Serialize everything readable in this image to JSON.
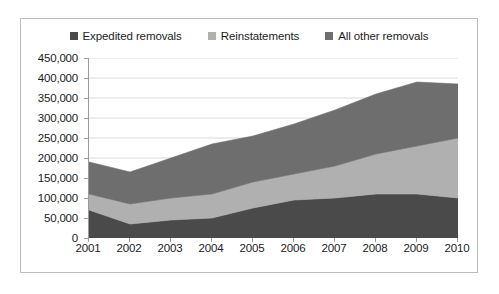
{
  "legend": {
    "position": "top-center",
    "items": [
      {
        "label": "Expedited removals",
        "color": "#4a4a4a",
        "icon": "square-marker"
      },
      {
        "label": "Reinstatements",
        "color": "#b0b0b0",
        "icon": "square-marker"
      },
      {
        "label": "All other removals",
        "color": "#6e6e6e",
        "icon": "square-marker"
      }
    ]
  },
  "chart_data": {
    "type": "area",
    "stacked": true,
    "title": "",
    "subtitle": "",
    "xlabel": "",
    "ylabel": "",
    "grid": true,
    "categories": [
      "2001",
      "2002",
      "2003",
      "2004",
      "2005",
      "2006",
      "2007",
      "2008",
      "2009",
      "2010"
    ],
    "x": [
      2001,
      2002,
      2003,
      2004,
      2005,
      2006,
      2007,
      2008,
      2009,
      2010
    ],
    "ylim": [
      0,
      450000
    ],
    "xlim": [
      2001,
      2010
    ],
    "ytick_labels": [
      "0",
      "50,000",
      "100,000",
      "150,000",
      "200,000",
      "250,000",
      "300,000",
      "350,000",
      "400,000",
      "450,000"
    ],
    "ytick_values": [
      0,
      50000,
      100000,
      150000,
      200000,
      250000,
      300000,
      350000,
      400000,
      450000
    ],
    "ytick_step": 50000,
    "xtick_labels": [
      "2001",
      "2002",
      "2003",
      "2004",
      "2005",
      "2006",
      "2007",
      "2008",
      "2009",
      "2010"
    ],
    "series": [
      {
        "name": "Expedited removals",
        "color": "#4a4a4a",
        "values": [
          70000,
          35000,
          45000,
          50000,
          75000,
          95000,
          100000,
          110000,
          110000,
          100000
        ]
      },
      {
        "name": "Reinstatements",
        "color": "#b0b0b0",
        "values": [
          40000,
          50000,
          55000,
          60000,
          65000,
          65000,
          80000,
          100000,
          120000,
          150000
        ]
      },
      {
        "name": "All other removals",
        "color": "#6e6e6e",
        "values": [
          80000,
          80000,
          100000,
          125000,
          115000,
          125000,
          140000,
          150000,
          160000,
          135000
        ]
      }
    ],
    "cumulative_totals": [
      190000,
      165000,
      200000,
      235000,
      255000,
      285000,
      320000,
      360000,
      390000,
      385000
    ]
  },
  "style": {
    "plot_background": "#ffffff",
    "frame_border": "#bdbdbd",
    "axis_line": "#9a9a9a",
    "gridline": "#d9d9d9",
    "text": "#1c1c1c"
  }
}
